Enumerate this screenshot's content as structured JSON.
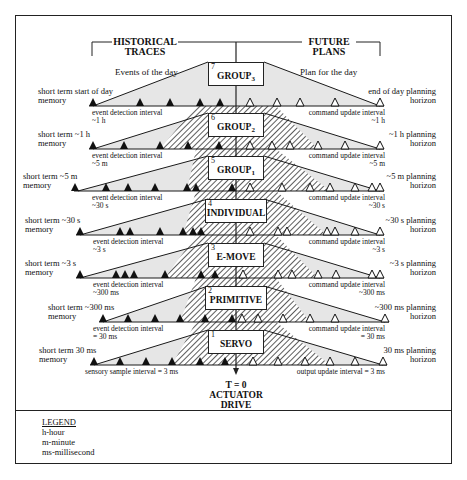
{
  "headers": {
    "left": "HISTORICAL TRACES",
    "left_line1": "HISTORICAL",
    "left_line2": "TRACES",
    "right_line1": "FUTURE",
    "right_line2": "PLANS"
  },
  "top_captions": {
    "left": "Events of the day",
    "right": "Plan for the day"
  },
  "levels": [
    {
      "number": "7",
      "name": "GROUP",
      "subscript": "3",
      "memory_label_1": "short term start of day",
      "memory_label_2": "memory",
      "horizon_label_1": "end of day planning",
      "horizon_label_2": "horizon",
      "detection_label_1": "event detection interval",
      "detection_label_2": "~1 h",
      "command_label_1": "command update interval",
      "command_label_2": "~1 h"
    },
    {
      "number": "6",
      "name": "GROUP",
      "subscript": "2",
      "memory_label_1": "short term ~1 h",
      "memory_label_2": "memory",
      "horizon_label_1": "~1 h planning",
      "horizon_label_2": "horizon",
      "detection_label_1": "event detection interval",
      "detection_label_2": "~5 m",
      "command_label_1": "command update interval",
      "command_label_2": "~5 m"
    },
    {
      "number": "5",
      "name": "GROUP",
      "subscript": "1",
      "memory_label_1": "short term ~5 m",
      "memory_label_2": "memory",
      "horizon_label_1": "~5 m planning",
      "horizon_label_2": "horizon",
      "detection_label_1": "event detection interval",
      "detection_label_2": "~30 s",
      "command_label_1": "command update interval",
      "command_label_2": "~30 s"
    },
    {
      "number": "4",
      "name": "INDIVIDUAL",
      "subscript": "",
      "memory_label_1": "short term ~30 s",
      "memory_label_2": "memory",
      "horizon_label_1": "~30 s planning",
      "horizon_label_2": "horizon",
      "detection_label_1": "event detection interval",
      "detection_label_2": "~3 s",
      "command_label_1": "command update interval",
      "command_label_2": "~3 s"
    },
    {
      "number": "3",
      "name": "E-MOVE",
      "subscript": "",
      "memory_label_1": "short term ~3 s",
      "memory_label_2": "memory",
      "horizon_label_1": "~3 s planning",
      "horizon_label_2": "horizon",
      "detection_label_1": "event detection interval",
      "detection_label_2": "~300 ms",
      "command_label_1": "command update interval",
      "command_label_2": "~300 ms"
    },
    {
      "number": "2",
      "name": "PRIMITIVE",
      "subscript": "",
      "memory_label_1": "short term ~300 ms",
      "memory_label_2": "memory",
      "horizon_label_1": "~300 ms planning",
      "horizon_label_2": "horizon",
      "detection_label_1": "event detection interval",
      "detection_label_2": "= 30 ms",
      "command_label_1": "command update interval",
      "command_label_2": "= 30 ms"
    },
    {
      "number": "1",
      "name": "SERVO",
      "subscript": "",
      "memory_label_1": "short term 30 ms",
      "memory_label_2": "memory",
      "horizon_label_1": "30 ms planning",
      "horizon_label_2": "horizon",
      "detection_label_1": "sensory sample interval = 3 ms",
      "detection_label_2": "",
      "command_label_1": "output update interval = 3 ms",
      "command_label_2": ""
    }
  ],
  "bottom": {
    "line1": "T = 0",
    "line2": "ACTUATOR DRIVE"
  },
  "legend": {
    "title": "LEGEND",
    "items": [
      "h-hour",
      "m-minute",
      "ms-millisecond"
    ]
  },
  "colors": {
    "line": "#1a1a1a",
    "fill_light": "#e6e6e6",
    "hatch": "#333333",
    "background": "#ffffff"
  }
}
